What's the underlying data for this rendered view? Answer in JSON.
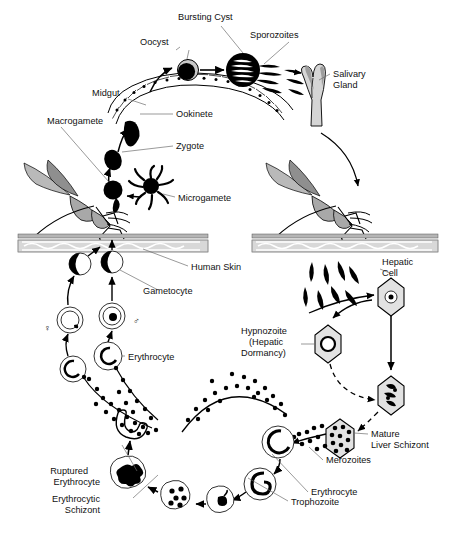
{
  "diagram": {
    "background": "#ffffff",
    "ink_color": "#000000",
    "leader_color": "#6f6f6f",
    "labels": {
      "bursting_cyst": "Bursting Cyst",
      "sporozoites": "Sporozoites",
      "oocyst": "Oocyst",
      "salivary_gland_l1": "Salivary",
      "salivary_gland_l2": "Gland",
      "midgut": "Midgut",
      "ookinete": "Ookinete",
      "macrogamete": "Macrogamete",
      "zygote": "Zygote",
      "microgamete": "Microgamete",
      "human_skin": "Human Skin",
      "gametocyte": "Gametocyte",
      "erythrocyte_left": "Erythrocyte",
      "hepatic_cell_l1": "Hepatic",
      "hepatic_cell_l2": "Cell",
      "hypnozoite_l1": "Hypnozoite",
      "hypnozoite_l2": "(Hepatic",
      "hypnozoite_l3": "Dormancy)",
      "mature_liver_schizont_l1": "Mature",
      "mature_liver_schizont_l2": "Liver Schizont",
      "merozoites": "Merozoites",
      "erythrocyte_right": "Erythrocyte",
      "trophozoite": "Trophozoite",
      "ruptured_erythrocyte_l1": "Ruptured",
      "ruptured_erythrocyte_l2": "Erythrocyte",
      "erythrocytic_schizont_l1": "Erythrocytic",
      "erythrocytic_schizont_l2": "Schizont",
      "female_symbol": "♀",
      "male_symbol": "♂"
    },
    "stages": [
      {
        "name": "oocyst",
        "label": "Oocyst",
        "host": "mosquito"
      },
      {
        "name": "bursting-cyst",
        "label": "Bursting Cyst",
        "host": "mosquito"
      },
      {
        "name": "sporozoites",
        "label": "Sporozoites",
        "host": "mosquito"
      },
      {
        "name": "salivary-gland",
        "label": "Salivary Gland",
        "host": "mosquito"
      },
      {
        "name": "midgut",
        "label": "Midgut",
        "host": "mosquito"
      },
      {
        "name": "ookinete",
        "label": "Ookinete",
        "host": "mosquito"
      },
      {
        "name": "zygote",
        "label": "Zygote",
        "host": "mosquito"
      },
      {
        "name": "macrogamete",
        "label": "Macrogamete",
        "host": "mosquito"
      },
      {
        "name": "microgamete",
        "label": "Microgamete",
        "host": "mosquito"
      },
      {
        "name": "human-skin",
        "label": "Human Skin",
        "host": "human"
      },
      {
        "name": "gametocyte",
        "label": "Gametocyte",
        "host": "human"
      },
      {
        "name": "erythrocyte",
        "label": "Erythrocyte",
        "host": "human"
      },
      {
        "name": "hepatic-cell",
        "label": "Hepatic Cell",
        "host": "human"
      },
      {
        "name": "hypnozoite",
        "label": "Hypnozoite (Hepatic Dormancy)",
        "host": "human"
      },
      {
        "name": "mature-liver-schizont",
        "label": "Mature Liver Schizont",
        "host": "human"
      },
      {
        "name": "merozoites",
        "label": "Merozoites",
        "host": "human"
      },
      {
        "name": "trophozoite",
        "label": "Trophozoite",
        "host": "human"
      },
      {
        "name": "erythrocytic-schizont",
        "label": "Erythrocytic Schizont",
        "host": "human"
      },
      {
        "name": "ruptured-erythrocyte",
        "label": "Ruptured Erythrocyte",
        "host": "human"
      }
    ]
  }
}
